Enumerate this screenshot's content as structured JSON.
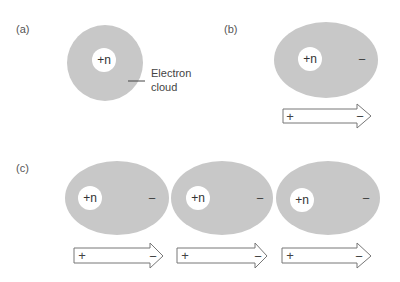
{
  "panels": {
    "a": {
      "label": "(a)",
      "nucleus_label": "+n",
      "annotation_line1": "Electron",
      "annotation_line2": "cloud"
    },
    "b": {
      "label": "(b)",
      "nucleus_label": "+n",
      "negative_sign": "−",
      "arrow_plus": "+",
      "arrow_minus": "−"
    },
    "c": {
      "label": "(c)",
      "atoms": [
        {
          "nucleus_label": "+n",
          "negative_sign": "−",
          "arrow_plus": "+",
          "arrow_minus": "−"
        },
        {
          "nucleus_label": "+n",
          "negative_sign": "−",
          "arrow_plus": "+",
          "arrow_minus": "−"
        },
        {
          "nucleus_label": "+n",
          "negative_sign": "−",
          "arrow_plus": "+",
          "arrow_minus": "−"
        }
      ]
    }
  },
  "colors": {
    "cloud": "#c8c8c8",
    "nucleus": "#ffffff",
    "arrow_stroke": "#777777",
    "text": "#444444"
  }
}
